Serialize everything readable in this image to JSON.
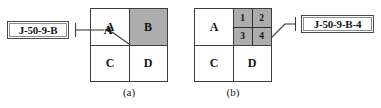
{
  "figure": {
    "callouts": [
      {
        "id": "left",
        "text": "J-50-9-B"
      },
      {
        "id": "right",
        "text": "J-50-9-B-4"
      }
    ],
    "panels": [
      {
        "caption": "(a)",
        "grid": {
          "rows": 2,
          "cols": 2,
          "cells": [
            {
              "label": "A",
              "position": "top-left",
              "shaded": false
            },
            {
              "label": "B",
              "position": "top-right",
              "shaded": true
            },
            {
              "label": "C",
              "position": "bottom-left",
              "shaded": false
            },
            {
              "label": "D",
              "position": "bottom-right",
              "shaded": false
            }
          ]
        },
        "leader_label": "A"
      },
      {
        "caption": "(b)",
        "grid": {
          "rows": 2,
          "cols": 2,
          "cells": [
            {
              "label": "A",
              "position": "top-left",
              "shaded": false
            },
            {
              "label": "",
              "position": "top-right",
              "shaded": true
            },
            {
              "label": "C",
              "position": "bottom-left",
              "shaded": false
            },
            {
              "label": "D",
              "position": "bottom-right",
              "shaded": false
            }
          ],
          "subgrid": {
            "parent": "top-right",
            "rows": 2,
            "cols": 2,
            "shaded": true,
            "cells": [
              {
                "label": "1",
                "position": "top-left"
              },
              {
                "label": "2",
                "position": "top-right"
              },
              {
                "label": "3",
                "position": "bottom-left"
              },
              {
                "label": "4",
                "position": "bottom-right"
              }
            ]
          }
        }
      }
    ],
    "colors": {
      "shade": "#adadad",
      "line": "#3d3d3d",
      "background": "#ffffff",
      "text": "#151515"
    }
  }
}
